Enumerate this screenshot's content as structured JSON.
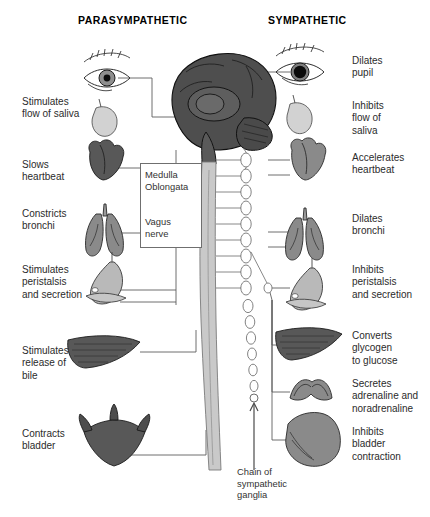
{
  "figure": {
    "title_left": "PARASYMPATHETIC",
    "title_right": "SYMPATHETIC"
  },
  "parasympathetic_labels": [
    {
      "id": "saliva",
      "text": "Stimulates\nflow of saliva"
    },
    {
      "id": "heart",
      "text": "Slows\nheartbeat"
    },
    {
      "id": "bronchi",
      "text": "Constricts\nbronchi"
    },
    {
      "id": "peristalsis",
      "text": "Stimulates\nperistalsis\nand secretion"
    },
    {
      "id": "bile",
      "text": "Stimulates\nrelease of\nbile"
    },
    {
      "id": "bladder",
      "text": "Contracts\nbladder"
    }
  ],
  "sympathetic_labels": [
    {
      "id": "pupil",
      "text": "Dilates\npupil"
    },
    {
      "id": "saliva",
      "text": "Inhibits\nflow of\nsaliva"
    },
    {
      "id": "heart",
      "text": "Accelerates\nheartbeat"
    },
    {
      "id": "bronchi",
      "text": "Dilates\nbronchi"
    },
    {
      "id": "peristalsis",
      "text": "Inhibits\nperistalsis\nand secretion"
    },
    {
      "id": "glycogen",
      "text": "Converts\nglycogen\nto glucose"
    },
    {
      "id": "adrenaline",
      "text": "Secretes\nadrenaline and\nnoradrenaline"
    },
    {
      "id": "bladder",
      "text": "Inhibits\nbladder\ncontraction"
    }
  ],
  "central_labels": [
    {
      "id": "medulla",
      "text": "Medulla\nOblongata"
    },
    {
      "id": "vagus",
      "text": "Vagus\nnerve"
    },
    {
      "id": "chain",
      "text": "Chain of\nsympathetic\nganglia"
    }
  ],
  "anatomy": {
    "brain": "sagittal-brain",
    "spinal_cord": "spinal-cord",
    "ganglia_chain": "sympathetic-ganglia-chain",
    "organs_left": [
      "eye-constricted",
      "salivary-gland",
      "heart",
      "lungs",
      "stomach",
      "liver",
      "bladder"
    ],
    "organs_right": [
      "eye-dilated",
      "salivary-gland",
      "heart",
      "lungs",
      "stomach",
      "liver",
      "adrenal-gland",
      "bladder"
    ]
  },
  "colors": {
    "organ_dark": "#585858",
    "organ_mid": "#8a8a8a",
    "organ_light": "#b9b9b9",
    "brain": "#4e4e4e",
    "cord": "#c9c9c9",
    "line": "#5d5d5d",
    "text": "#2b2b2b",
    "background": "#ffffff"
  }
}
